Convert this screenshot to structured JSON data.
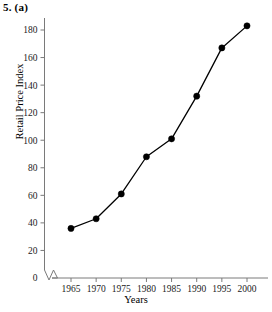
{
  "figure": {
    "caption": "5. (a)"
  },
  "chart_data": {
    "type": "line",
    "title": "",
    "xlabel": "Years",
    "ylabel": "Retail Price Index",
    "x": [
      1965,
      1970,
      1975,
      1980,
      1985,
      1990,
      1995,
      2000
    ],
    "values": [
      36,
      43,
      61,
      88,
      101,
      132,
      167,
      183
    ],
    "xticks": [
      "1965",
      "1970",
      "1975",
      "1980",
      "1985",
      "1990",
      "1995",
      "2000"
    ],
    "yticks": [
      "0",
      "20",
      "40",
      "60",
      "80",
      "100",
      "120",
      "140",
      "160",
      "180"
    ],
    "xlim": [
      1962.5,
      2002.5
    ],
    "ylim": [
      0,
      190
    ],
    "grid": false,
    "legend": null,
    "axis_break": true,
    "marker": "filled-circle",
    "line_color": "#000000",
    "marker_color": "#000000",
    "axis_color": "#7a7a7a",
    "background": "#ffffff"
  }
}
